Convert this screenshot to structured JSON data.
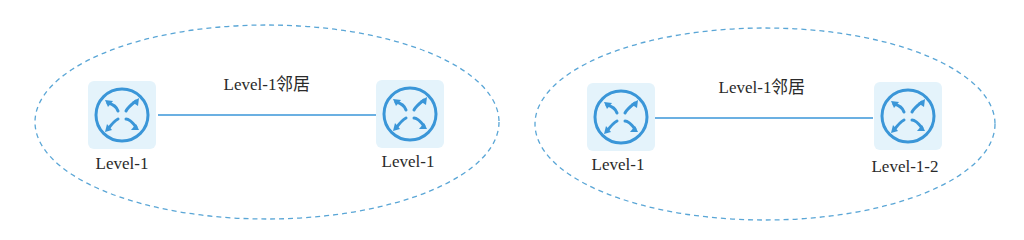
{
  "colors": {
    "ellipse_stroke": "#5aa6d6",
    "link": "#3a96d8",
    "router_fill": "#e4f3fb",
    "router_icon": "#3a96d8",
    "text": "#2a2a2a"
  },
  "areas": [
    {
      "link_label": "Level-1邻居",
      "routers": [
        {
          "label": "Level-1",
          "icon": "router-icon"
        },
        {
          "label": "Level-1",
          "icon": "router-icon"
        }
      ]
    },
    {
      "link_label": "Level-1邻居",
      "routers": [
        {
          "label": "Level-1",
          "icon": "router-icon"
        },
        {
          "label": "Level-1-2",
          "icon": "router-icon"
        }
      ]
    }
  ]
}
